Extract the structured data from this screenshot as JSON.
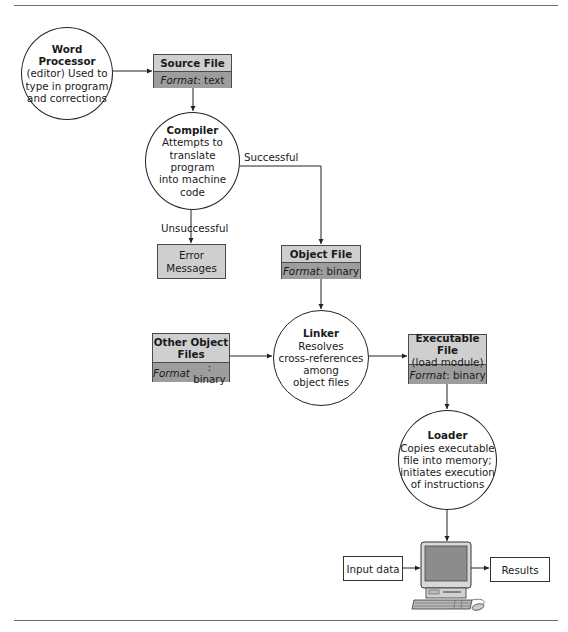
{
  "diagram": {
    "type": "flowchart",
    "nodes": {
      "word_processor": {
        "shape": "circle",
        "title": "Word Processor",
        "lines": [
          "(editor) Used to",
          "type in program",
          "and corrections"
        ]
      },
      "source_file": {
        "shape": "file-box",
        "title": "Source File",
        "format_label": "Format",
        "format_value": ": text"
      },
      "compiler": {
        "shape": "circle",
        "title": "Compiler",
        "lines": [
          "Attempts to",
          "translate program",
          "into machine",
          "code"
        ]
      },
      "error_messages": {
        "shape": "box",
        "lines": [
          "Error",
          "Messages"
        ]
      },
      "object_file": {
        "shape": "file-box",
        "title": "Object File",
        "format_label": "Format",
        "format_value": ": binary"
      },
      "other_object_files": {
        "shape": "file-box",
        "title_lines": [
          "Other Object",
          "Files"
        ],
        "format_label": "Format",
        "format_value": ": binary"
      },
      "linker": {
        "shape": "circle",
        "title": "Linker",
        "lines": [
          "Resolves",
          "cross-references",
          "among",
          "object files"
        ]
      },
      "executable_file": {
        "shape": "file-box",
        "title": "Executable File",
        "subtitle": "(load module)",
        "format_label": "Format",
        "format_value": ": binary"
      },
      "loader": {
        "shape": "circle",
        "title": "Loader",
        "lines": [
          "Copies executable",
          "file into memory;",
          "initiates execution",
          "of instructions"
        ]
      },
      "input_data": {
        "shape": "box",
        "label": "Input data"
      },
      "computer": {
        "shape": "computer-icon"
      },
      "results": {
        "shape": "box",
        "label": "Results"
      }
    },
    "edges": [
      {
        "from": "word_processor",
        "to": "source_file",
        "label": ""
      },
      {
        "from": "source_file",
        "to": "compiler",
        "label": ""
      },
      {
        "from": "compiler",
        "to": "object_file",
        "label": "Successful"
      },
      {
        "from": "compiler",
        "to": "error_messages",
        "label": "Unsuccessful"
      },
      {
        "from": "object_file",
        "to": "linker",
        "label": ""
      },
      {
        "from": "other_object_files",
        "to": "linker",
        "label": ""
      },
      {
        "from": "linker",
        "to": "executable_file",
        "label": ""
      },
      {
        "from": "executable_file",
        "to": "loader",
        "label": ""
      },
      {
        "from": "loader",
        "to": "computer",
        "label": ""
      },
      {
        "from": "input_data",
        "to": "computer",
        "label": ""
      },
      {
        "from": "computer",
        "to": "results",
        "label": ""
      }
    ],
    "edge_labels": {
      "successful": "Successful",
      "unsuccessful": "Unsuccessful"
    },
    "colors": {
      "header_fill": "#cfcfcf",
      "format_fill": "#9d9d9d",
      "line": "#222222",
      "screen": "#8c8c8c"
    }
  }
}
